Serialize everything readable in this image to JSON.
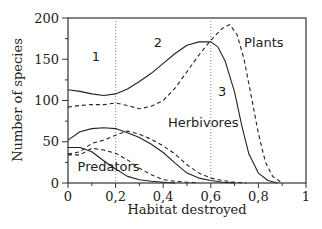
{
  "chart_data": {
    "type": "line",
    "title": "",
    "xlabel": "Habitat destroyed",
    "ylabel": "Number of species",
    "xlim": [
      0,
      1
    ],
    "ylim": [
      0,
      200
    ],
    "xticks": [
      "0",
      "0,2",
      "0,4",
      "0,6",
      "0,8",
      "1"
    ],
    "xtick_values": [
      0,
      0.2,
      0.4,
      0.6,
      0.8,
      1.0
    ],
    "yticks": [
      "0",
      "50",
      "100",
      "150",
      "200"
    ],
    "ytick_values": [
      0,
      50,
      100,
      150,
      200
    ],
    "grid": false,
    "vertical_reference_lines": [
      0.2,
      0.6
    ],
    "annotations": [
      {
        "text": "1",
        "x": 0.1,
        "y": 148
      },
      {
        "text": "2",
        "x": 0.36,
        "y": 165
      },
      {
        "text": "3",
        "x": 0.63,
        "y": 105
      },
      {
        "text": "Plants",
        "x": 0.74,
        "y": 165
      },
      {
        "text": "Herbivores",
        "x": 0.42,
        "y": 68
      },
      {
        "text": "Predators",
        "x": 0.04,
        "y": 14
      }
    ],
    "series": [
      {
        "name": "Plants (solid)",
        "group": "Plants",
        "style": "solid",
        "x": [
          0,
          0.05,
          0.1,
          0.15,
          0.2,
          0.25,
          0.3,
          0.35,
          0.4,
          0.45,
          0.5,
          0.55,
          0.6,
          0.63,
          0.66,
          0.7,
          0.73,
          0.76,
          0.8,
          0.84,
          0.88
        ],
        "y": [
          113,
          111,
          108,
          106,
          108,
          114,
          123,
          133,
          145,
          157,
          167,
          171,
          171,
          165,
          148,
          110,
          70,
          35,
          12,
          3,
          0
        ]
      },
      {
        "name": "Plants (dashed)",
        "group": "Plants",
        "style": "dashed",
        "x": [
          0,
          0.05,
          0.1,
          0.15,
          0.2,
          0.25,
          0.3,
          0.35,
          0.4,
          0.45,
          0.5,
          0.55,
          0.6,
          0.65,
          0.68,
          0.71,
          0.74,
          0.77,
          0.8,
          0.83,
          0.86,
          0.9
        ],
        "y": [
          92,
          94,
          95,
          95,
          97,
          94,
          90,
          93,
          100,
          115,
          135,
          155,
          173,
          188,
          192,
          180,
          150,
          105,
          60,
          25,
          8,
          0
        ]
      },
      {
        "name": "Herbivores (solid)",
        "group": "Herbivores",
        "style": "solid",
        "x": [
          0,
          0.05,
          0.1,
          0.15,
          0.2,
          0.25,
          0.3,
          0.35,
          0.4,
          0.45,
          0.5,
          0.55,
          0.6,
          0.65,
          0.7
        ],
        "y": [
          52,
          62,
          66,
          67,
          66,
          61,
          55,
          47,
          37,
          24,
          12,
          6,
          3,
          1,
          0
        ]
      },
      {
        "name": "Herbivores (dashed)",
        "group": "Herbivores",
        "style": "dashed",
        "x": [
          0,
          0.05,
          0.1,
          0.15,
          0.2,
          0.25,
          0.3,
          0.35,
          0.4,
          0.45,
          0.5,
          0.55,
          0.6,
          0.65,
          0.7,
          0.75
        ],
        "y": [
          35,
          38,
          48,
          52,
          58,
          63,
          59,
          53,
          45,
          35,
          22,
          12,
          6,
          3,
          1,
          0
        ]
      },
      {
        "name": "Predators (solid)",
        "group": "Predators",
        "style": "solid",
        "x": [
          0,
          0.05,
          0.1,
          0.15,
          0.2,
          0.25,
          0.3,
          0.35,
          0.4,
          0.45
        ],
        "y": [
          43,
          43,
          38,
          27,
          17,
          8,
          4,
          2,
          1,
          0
        ]
      },
      {
        "name": "Predators (dashed)",
        "group": "Predators",
        "style": "dashed",
        "x": [
          0,
          0.05,
          0.1,
          0.15,
          0.2,
          0.25,
          0.3,
          0.35,
          0.4,
          0.45,
          0.5,
          0.55
        ],
        "y": [
          34,
          34,
          42,
          40,
          36,
          28,
          18,
          10,
          4,
          2,
          1,
          0
        ]
      }
    ]
  },
  "colors": {
    "line": "#222222",
    "axis": "#333333",
    "reference_line": "#888888",
    "background": "#ffffff"
  }
}
